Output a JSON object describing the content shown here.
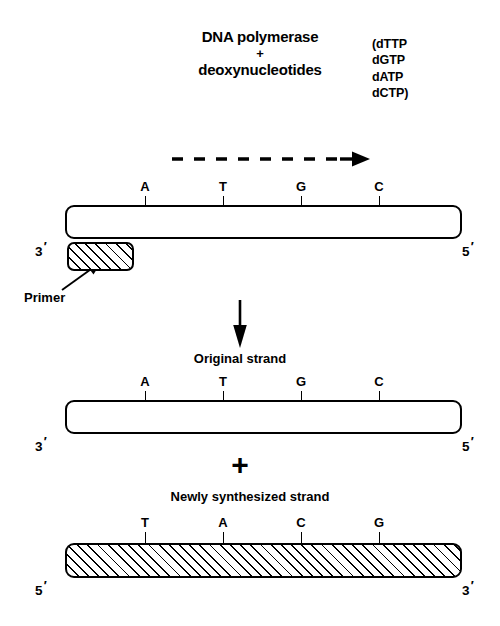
{
  "figure": {
    "reaction": {
      "enzyme": "DNA polymerase",
      "plus": "+",
      "substrate": "deoxynucleotides",
      "dntps": [
        "(dTTP",
        "dGTP",
        "dATP",
        "dCTP)"
      ]
    },
    "direction_arrow": {
      "style": "dashed",
      "points": "right",
      "dash_count": 8
    },
    "template_strand": {
      "bases": [
        "A",
        "T",
        "G",
        "C"
      ],
      "left_end": "3",
      "right_end": "5",
      "prime_mark": "′",
      "fill": "white"
    },
    "primer": {
      "label": "Primer",
      "fill": "hatched"
    },
    "reaction_arrow": {
      "style": "solid",
      "points": "down"
    },
    "original_strand": {
      "caption": "Original strand",
      "bases": [
        "A",
        "T",
        "G",
        "C"
      ],
      "left_end": "3",
      "right_end": "5",
      "prime_mark": "′",
      "fill": "white"
    },
    "combine_sign": "+",
    "new_strand": {
      "caption": "Newly synthesized strand",
      "bases": [
        "T",
        "A",
        "C",
        "G"
      ],
      "left_end": "5",
      "right_end": "3",
      "prime_mark": "′",
      "fill": "hatched"
    },
    "colors": {
      "ink": "#000000",
      "paper": "#ffffff"
    }
  }
}
